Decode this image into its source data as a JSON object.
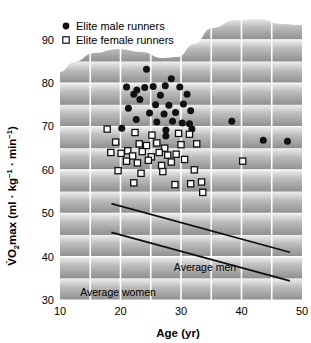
{
  "figure": {
    "kind": "scatter-plot",
    "background_style": "gray-horizontal-banded-gradient-with-wavy-top",
    "plot_bg_light": "#f2f2f2",
    "plot_bg_dark": "#9a9a9a",
    "gridline_color": "#ffffff",
    "marker_male_color": "#111111",
    "marker_female_fill": "#ffffff",
    "marker_female_stroke": "#111111",
    "trendline_color": "#111111"
  },
  "legend": {
    "position": "top-left",
    "entries": [
      {
        "marker": "filled-circle",
        "label": "Elite male runners"
      },
      {
        "marker": "open-square",
        "label": "Elite female runners"
      }
    ]
  },
  "axes": {
    "x": {
      "label": "Age (yr)",
      "ticks": [
        "10",
        "20",
        "30",
        "40",
        "50"
      ],
      "tick_values": [
        10,
        20,
        30,
        40,
        50
      ],
      "range": [
        10,
        50
      ],
      "minor_gridlines_every": 5
    },
    "y": {
      "label_parts": {
        "v": "V",
        "dot": "̇",
        "o": "O",
        "two": "2",
        "rest": "max (ml · kg",
        "exp1": "−1",
        "middot": " · min",
        "exp2": "−1",
        "close": ")"
      },
      "label_plain": "V̇O2max (ml · kg−1 · min−1)",
      "ticks": [
        "30",
        "40",
        "50",
        "60",
        "70",
        "80",
        "90"
      ],
      "tick_values": [
        30,
        40,
        50,
        60,
        70,
        80,
        90
      ],
      "range": [
        30,
        95
      ]
    }
  },
  "annotations": [
    {
      "name": "average-men-label",
      "text": "Average men"
    },
    {
      "name": "average-women-label",
      "text": "Average women"
    }
  ],
  "chart_data": {
    "type": "scatter",
    "title": "",
    "xlabel": "Age (yr)",
    "ylabel": "V̇O2max (ml · kg−1 · min−1)",
    "xlim": [
      10,
      50
    ],
    "ylim": [
      30,
      95
    ],
    "xticks": [
      10,
      20,
      30,
      40,
      50
    ],
    "yticks": [
      30,
      40,
      50,
      60,
      70,
      80,
      90
    ],
    "grid": true,
    "grid_orientation": "both",
    "legend_position": "top-left",
    "series": [
      {
        "name": "Elite male runners",
        "marker": "filled-circle",
        "color": "#111111",
        "points": [
          [
            24.3,
            83.2
          ],
          [
            21.0,
            79.1
          ],
          [
            22.7,
            78.4
          ],
          [
            24.0,
            79.0
          ],
          [
            25.4,
            79.2
          ],
          [
            27.4,
            79.4
          ],
          [
            28.4,
            81.0
          ],
          [
            29.8,
            79.1
          ],
          [
            22.2,
            77.4
          ],
          [
            23.2,
            76.2
          ],
          [
            25.8,
            75.0
          ],
          [
            26.6,
            77.2
          ],
          [
            28.0,
            74.9
          ],
          [
            30.4,
            75.2
          ],
          [
            31.0,
            77.4
          ],
          [
            21.3,
            74.2
          ],
          [
            24.8,
            73.1
          ],
          [
            27.2,
            72.9
          ],
          [
            29.1,
            73.2
          ],
          [
            31.6,
            73.6
          ],
          [
            22.6,
            71.6
          ],
          [
            26.0,
            71.0
          ],
          [
            28.6,
            71.2
          ],
          [
            30.2,
            70.8
          ],
          [
            31.4,
            70.6
          ],
          [
            20.2,
            69.6
          ],
          [
            27.5,
            69.2
          ],
          [
            27.5,
            67.8
          ],
          [
            31.8,
            69.4
          ],
          [
            38.4,
            71.2
          ],
          [
            43.6,
            66.8
          ],
          [
            47.6,
            66.6
          ]
        ]
      },
      {
        "name": "Elite female runners",
        "marker": "open-square",
        "color": "#111111",
        "points": [
          [
            17.8,
            69.4
          ],
          [
            22.4,
            68.6
          ],
          [
            25.2,
            68.0
          ],
          [
            29.6,
            68.4
          ],
          [
            31.4,
            68.2
          ],
          [
            19.2,
            66.4
          ],
          [
            23.1,
            66.0
          ],
          [
            24.3,
            65.6
          ],
          [
            26.0,
            66.2
          ],
          [
            27.3,
            65.0
          ],
          [
            30.0,
            65.8
          ],
          [
            32.6,
            66.0
          ],
          [
            18.4,
            64.0
          ],
          [
            20.1,
            63.8
          ],
          [
            21.2,
            64.4
          ],
          [
            22.0,
            63.2
          ],
          [
            23.6,
            64.2
          ],
          [
            25.1,
            63.0
          ],
          [
            26.4,
            64.0
          ],
          [
            27.8,
            63.4
          ],
          [
            29.2,
            63.6
          ],
          [
            21.0,
            62.0
          ],
          [
            22.8,
            61.6
          ],
          [
            24.6,
            62.2
          ],
          [
            26.8,
            61.0
          ],
          [
            28.4,
            61.8
          ],
          [
            30.6,
            62.4
          ],
          [
            19.6,
            59.8
          ],
          [
            23.4,
            59.2
          ],
          [
            27.0,
            59.6
          ],
          [
            32.2,
            60.0
          ],
          [
            22.2,
            57.0
          ],
          [
            29.0,
            56.6
          ],
          [
            31.6,
            56.8
          ],
          [
            33.4,
            57.2
          ],
          [
            33.6,
            54.8
          ],
          [
            40.2,
            62.0
          ]
        ]
      }
    ],
    "trendlines": [
      {
        "name": "Average men",
        "label": "Average men",
        "x": [
          18.5,
          48.0
        ],
        "y": [
          52.2,
          41.0
        ]
      },
      {
        "name": "Average women",
        "label": "Average women",
        "x": [
          18.5,
          48.0
        ],
        "y": [
          45.6,
          34.4
        ]
      }
    ]
  }
}
